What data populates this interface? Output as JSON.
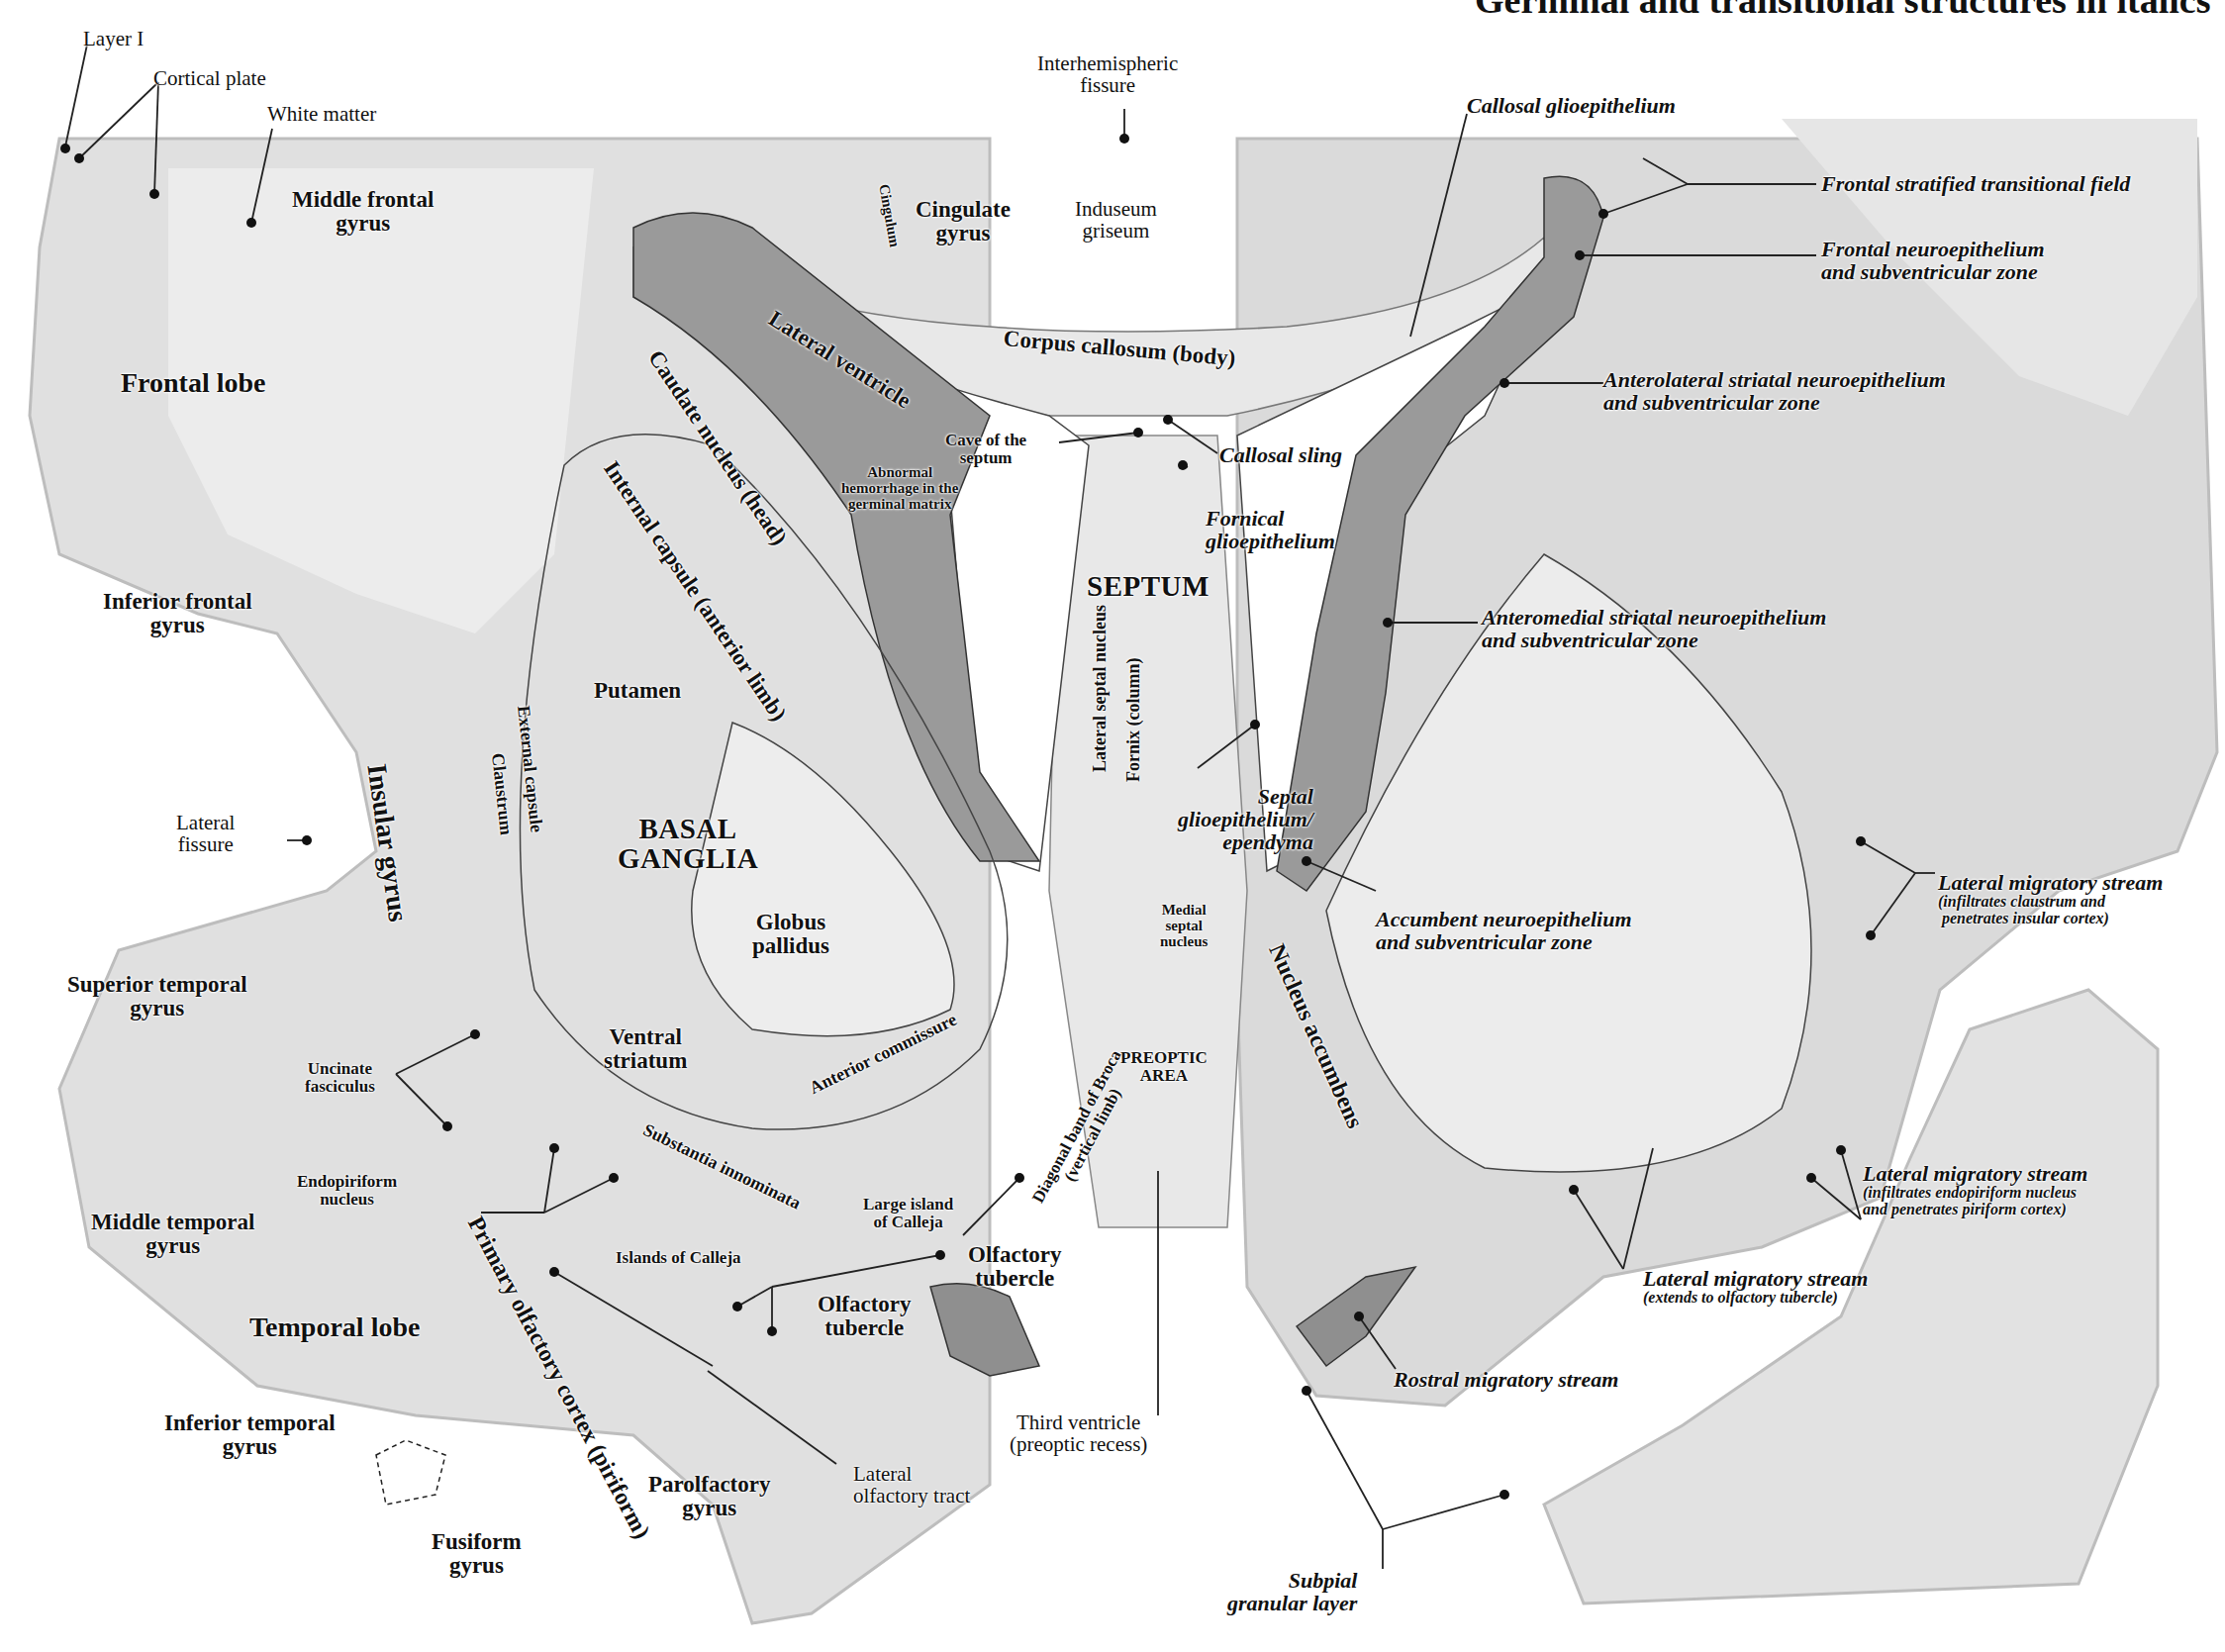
{
  "header": {
    "title": "Germinal and transitional structures in italics"
  },
  "colors": {
    "background": "#ffffff",
    "tissue_light": "#e4e4e4",
    "tissue_mid": "#cfcfcf",
    "germinal_dark": "#8f8f8f",
    "text": "#111111"
  },
  "labels": {
    "layer_i": "Layer I",
    "cortical_plate": "Cortical plate",
    "white_matter": "White matter",
    "middle_frontal_gyrus": [
      "Middle frontal",
      "gyrus"
    ],
    "frontal_lobe": "Frontal lobe",
    "inferior_frontal_gyrus": [
      "Inferior frontal",
      "gyrus"
    ],
    "lateral_fissure": [
      "Lateral",
      "fissure"
    ],
    "insular_gyrus": "Insular gyrus",
    "superior_temporal_gyrus": [
      "Superior temporal",
      "gyrus"
    ],
    "middle_temporal_gyrus": [
      "Middle temporal",
      "gyrus"
    ],
    "temporal_lobe": "Temporal lobe",
    "inferior_temporal_gyrus": [
      "Inferior temporal",
      "gyrus"
    ],
    "fusiform_gyrus": [
      "Fusiform",
      "gyrus"
    ],
    "parolfactory_gyrus": [
      "Parolfactory",
      "gyrus"
    ],
    "lateral_olfactory_tract": [
      "Lateral",
      "olfactory tract"
    ],
    "primary_olfactory_cortex": "Primary olfactory cortex (piriform)",
    "islands_of_calleja": "Islands of Calleja",
    "olfactory_tubercle_left": [
      "Olfactory",
      "tubercle"
    ],
    "olfactory_tubercle_mid": [
      "Olfactory",
      "tubercle"
    ],
    "large_island_of_calleja": [
      "Large island",
      "of Calleja"
    ],
    "substantia_innominata": "Substantia innominata",
    "endopiriform_nucleus": [
      "Endopiriform",
      "nucleus"
    ],
    "uncinate_fasciculus": [
      "Uncinate",
      "fasciculus"
    ],
    "ventral_striatum": [
      "Ventral",
      "striatum"
    ],
    "anterior_commissure": "Anterior commissure",
    "globus_pallidus": [
      "Globus",
      "pallidus"
    ],
    "basal_ganglia": [
      "BASAL",
      "GANGLIA"
    ],
    "putamen": "Putamen",
    "external_capsule": "External capsule",
    "claustrum": "Claustrum",
    "internal_capsule": "Internal capsule (anterior limb)",
    "caudate_nucleus": "Caudate nucleus (head)",
    "lateral_ventricle": "Lateral ventricle",
    "abnormal_hemorrhage": [
      "Abnormal",
      "hemorrhage in the",
      "germinal matrix"
    ],
    "cingulum": "Cingulum",
    "cingulate_gyrus": [
      "Cingulate",
      "gyrus"
    ],
    "interhemispheric_fissure": [
      "Interhemispheric",
      "fissure"
    ],
    "induseum_griseum": [
      "Induseum",
      "griseum"
    ],
    "corpus_callosum": "Corpus callosum (body)",
    "cave_of_septum": [
      "Cave of the",
      "septum"
    ],
    "callosal_sling": "Callosal sling",
    "fornical_glioepithelium": [
      "Fornical",
      "glioepithelium"
    ],
    "septum": "SEPTUM",
    "lateral_septal_nucleus": "Lateral septal nucleus",
    "fornix_column": "Fornix (column)",
    "septal_glioepithelium": [
      "Septal",
      "glioepithelium/",
      "ependyma"
    ],
    "medial_septal_nucleus": [
      "Medial",
      "septal",
      "nucleus"
    ],
    "diagonal_band": [
      "Diagonal band of Broca",
      "(vertical limb)"
    ],
    "preoptic_area": [
      "PREOPTIC",
      "AREA"
    ],
    "third_ventricle": [
      "Third ventricle",
      "(preoptic recess)"
    ],
    "nucleus_accumbens": "Nucleus accumbens",
    "callosal_glioepithelium": "Callosal glioepithelium",
    "frontal_stratified_transitional_field": "Frontal stratified transitional field",
    "frontal_neuroepithelium": [
      "Frontal neuroepithelium",
      "and subventricular zone"
    ],
    "anterolateral_striatal": [
      "Anterolateral striatal neuroepithelium",
      "and subventricular zone"
    ],
    "anteromedial_striatal": [
      "Anteromedial striatal neuroepithelium",
      "and subventricular zone"
    ],
    "accumbent_neuroepithelium": [
      "Accumbent neuroepithelium",
      "and subventricular zone"
    ],
    "lateral_migratory_stream_1": [
      "Lateral migratory stream",
      "(infiltrates claustrum and",
      "penetrates insular cortex)"
    ],
    "lateral_migratory_stream_2": [
      "Lateral migratory stream",
      "(infiltrates endopiriform nucleus",
      "and penetrates piriform cortex)"
    ],
    "lateral_migratory_stream_3": [
      "Lateral migratory stream",
      "(extends to olfactory tubercle)"
    ],
    "rostral_migratory_stream": "Rostral migratory stream",
    "subpial_granular_layer": [
      "Subpial",
      "granular layer"
    ]
  }
}
